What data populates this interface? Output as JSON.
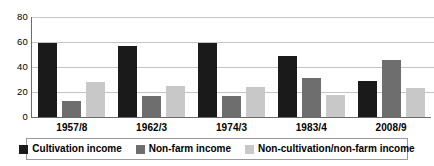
{
  "chart_data": {
    "type": "bar",
    "title": "",
    "subtitle": "",
    "xlabel": "",
    "ylabel": "",
    "categories": [
      "1957/8",
      "1962/3",
      "1974/3",
      "1983/4",
      "2008/9"
    ],
    "series": [
      {
        "name": "Cultivation income",
        "color": "#1a1a1a",
        "values": [
          59,
          57,
          59,
          49,
          29
        ]
      },
      {
        "name": "Non-farm income",
        "color": "#6e6e6e",
        "values": [
          13,
          17,
          17,
          31,
          46
        ]
      },
      {
        "name": "Non-cultivation/non-farm income",
        "color": "#c8c8c8",
        "values": [
          28,
          25,
          24,
          18,
          23
        ]
      }
    ],
    "ylim": [
      0,
      80
    ],
    "yticks": [
      0,
      20,
      40,
      60,
      80
    ],
    "ytick_labels": [
      "0",
      "20",
      "40",
      "60",
      "80"
    ],
    "grid": true,
    "grid_color": "#c4c4c4",
    "legend_position": "bottom",
    "axis_color": "#6b6b6b",
    "background": "#ffffff"
  }
}
